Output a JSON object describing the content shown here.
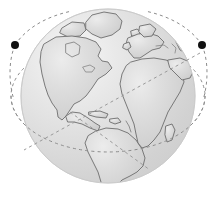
{
  "figure": {
    "title": "Earth globe with dashed orbital paths",
    "width": 219,
    "height": 205,
    "background_color": "#ffffff",
    "caption": ""
  },
  "globe": {
    "name": "earth-globe",
    "center_x": 108,
    "center_y": 96,
    "radius": 87,
    "ocean_fill_color": "#dcdcdc",
    "ocean_highlight_color": "#f2f2f2",
    "landmass_fill_color": "#d0d0d0",
    "landmass_stroke_color": "#6b6b6b",
    "landmass_stroke_width": 0.9,
    "edge_stroke_color": "#c8c8c8",
    "lighting": "highlight-upper-left",
    "projection": "orthographic",
    "center_longitude": "-30",
    "center_latitude": "20",
    "landmasses": [
      "north-america",
      "south-america",
      "greenland",
      "europe",
      "africa",
      "middle-east",
      "iceland",
      "british-isles",
      "caribbean",
      "madagascar"
    ]
  },
  "orbits": [
    {
      "name": "equatorial-orbit",
      "type": "ellipse",
      "center_x": 108,
      "center_y": 96,
      "rx": 97,
      "ry": 56,
      "rotation_deg": 0,
      "stroke_color": "#8c8c8c",
      "stroke_width": 1,
      "dash_pattern": "3,3.2"
    },
    {
      "name": "inclined-orbit-right-descending",
      "type": "line",
      "x1": 200,
      "y1": 53,
      "x2": 24,
      "y2": 150,
      "stroke_color": "#9a9a9a",
      "stroke_width": 1,
      "dash_pattern": "3,3.2"
    },
    {
      "name": "inclined-orbit-left-descending",
      "type": "line",
      "x1": 70,
      "y1": 112,
      "x2": 150,
      "y2": 170,
      "stroke_color": "#9a9a9a",
      "stroke_width": 1,
      "dash_pattern": "3,3.2"
    }
  ],
  "nodes": [
    {
      "name": "orbit-node-left",
      "label": "",
      "cx": 15,
      "cy": 45,
      "r": 4,
      "color": "#111111"
    },
    {
      "name": "orbit-node-right",
      "label": "",
      "cx": 202,
      "cy": 45,
      "r": 4,
      "color": "#111111"
    }
  ]
}
